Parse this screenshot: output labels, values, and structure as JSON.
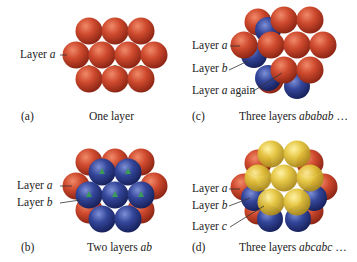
{
  "colors": {
    "red": "#c9452b",
    "blue": "#2f3f8f",
    "yellow": "#e2c23a",
    "green": "#3a8a3a"
  },
  "panels": [
    {
      "id": "a",
      "tag": "(a)",
      "caption": "One layer",
      "caption_italic": "",
      "labels": [
        {
          "text": "Layer ",
          "italic": "a",
          "suffix": ""
        }
      ]
    },
    {
      "id": "b",
      "tag": "(b)",
      "caption": "Two layers ",
      "caption_italic": "ab",
      "labels": [
        {
          "text": "Layer ",
          "italic": "a",
          "suffix": ""
        },
        {
          "text": "Layer ",
          "italic": "b",
          "suffix": ""
        }
      ]
    },
    {
      "id": "c",
      "tag": "(c)",
      "caption": "Three layers ",
      "caption_italic": "ababab",
      "caption_suffix": " …",
      "labels": [
        {
          "text": "Layer ",
          "italic": "a",
          "suffix": ""
        },
        {
          "text": "Layer ",
          "italic": "b",
          "suffix": ""
        },
        {
          "text": "Layer ",
          "italic": "a",
          "suffix": " again"
        }
      ]
    },
    {
      "id": "d",
      "tag": "(d)",
      "caption": "Three layers ",
      "caption_italic": "abcabc",
      "caption_suffix": " …",
      "labels": [
        {
          "text": "Layer ",
          "italic": "a",
          "suffix": ""
        },
        {
          "text": "Layer ",
          "italic": "b",
          "suffix": ""
        },
        {
          "text": "Layer ",
          "italic": "c",
          "suffix": ""
        }
      ]
    }
  ]
}
